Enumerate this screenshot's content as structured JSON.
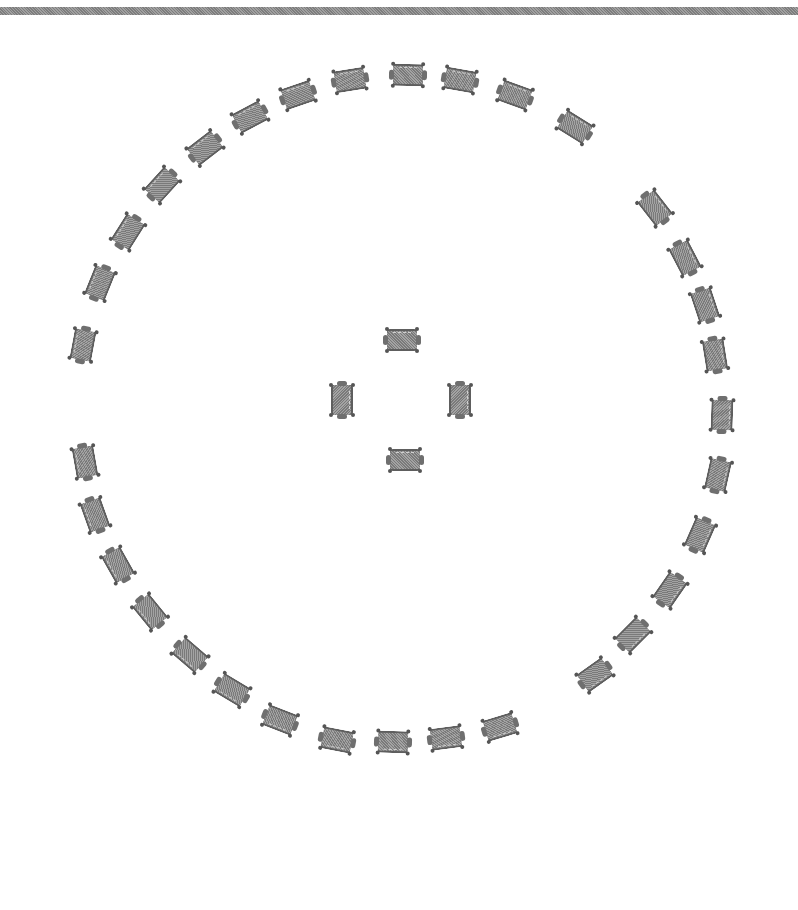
{
  "diagram": {
    "type": "circular-arrangement",
    "top_bar": {
      "color": "#8a8a8a"
    },
    "unit_color": "#8c8c8c",
    "ring_center": [
      403,
      405
    ],
    "ring_radius": 330,
    "outer_units": [
      {
        "x": 83,
        "y": 345
      },
      {
        "x": 100,
        "y": 283
      },
      {
        "x": 128,
        "y": 232
      },
      {
        "x": 162,
        "y": 185
      },
      {
        "x": 205,
        "y": 148
      },
      {
        "x": 250,
        "y": 117
      },
      {
        "x": 298,
        "y": 95
      },
      {
        "x": 350,
        "y": 80
      },
      {
        "x": 408,
        "y": 75
      },
      {
        "x": 460,
        "y": 80
      },
      {
        "x": 515,
        "y": 95
      },
      {
        "x": 575,
        "y": 127
      },
      {
        "x": 655,
        "y": 208
      },
      {
        "x": 685,
        "y": 258
      },
      {
        "x": 705,
        "y": 305
      },
      {
        "x": 715,
        "y": 355
      },
      {
        "x": 722,
        "y": 415
      },
      {
        "x": 718,
        "y": 475
      },
      {
        "x": 700,
        "y": 535
      },
      {
        "x": 670,
        "y": 590
      },
      {
        "x": 633,
        "y": 635
      },
      {
        "x": 595,
        "y": 675
      },
      {
        "x": 85,
        "y": 462
      },
      {
        "x": 95,
        "y": 515
      },
      {
        "x": 118,
        "y": 565
      },
      {
        "x": 150,
        "y": 612
      },
      {
        "x": 190,
        "y": 655
      },
      {
        "x": 232,
        "y": 690
      },
      {
        "x": 280,
        "y": 720
      },
      {
        "x": 337,
        "y": 740
      },
      {
        "x": 393,
        "y": 742
      },
      {
        "x": 446,
        "y": 738
      },
      {
        "x": 500,
        "y": 727
      }
    ],
    "center_units": [
      {
        "x": 402,
        "y": 340,
        "rot": 0
      },
      {
        "x": 460,
        "y": 400,
        "rot": 90
      },
      {
        "x": 405,
        "y": 460,
        "rot": 0
      },
      {
        "x": 342,
        "y": 400,
        "rot": 90
      }
    ]
  }
}
